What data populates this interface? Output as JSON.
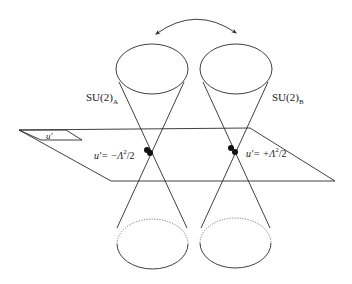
{
  "diagram": {
    "labels": {
      "su2_a": {
        "main": "SU(2)",
        "sub": "A"
      },
      "su2_b": {
        "main": "SU(2)",
        "sub": "B"
      },
      "plane": "u'",
      "point_left": {
        "prefix": "u'= −Λ",
        "sup": "2",
        "suffix": "/2"
      },
      "point_right": {
        "prefix": "u'= +Λ",
        "sup": "2",
        "suffix": "/2"
      }
    },
    "elements": {
      "arrow": "double-headed-curved-arrow",
      "cones": [
        "cone-A",
        "cone-B"
      ],
      "plane": "moduli-plane"
    },
    "colors": {
      "ink": "#2a2a2a",
      "dotted": "#6a6a6a",
      "dot": "#111111"
    }
  }
}
